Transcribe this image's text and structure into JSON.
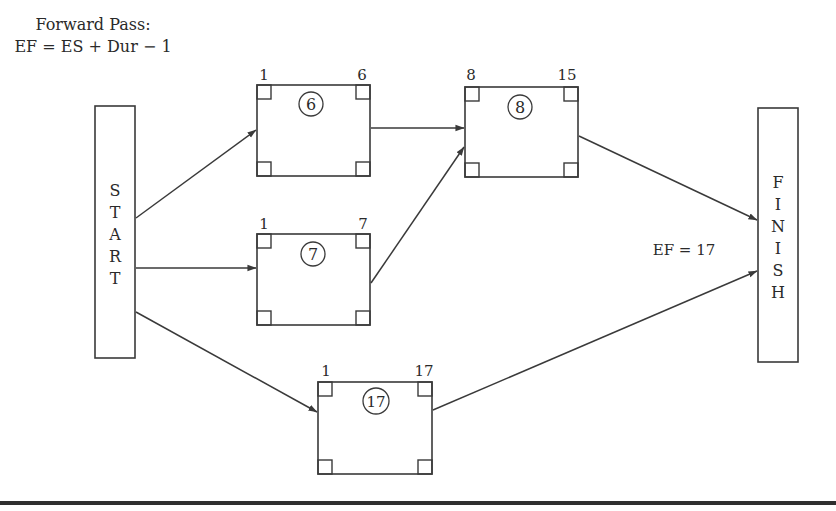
{
  "header": {
    "line1": "Forward Pass:",
    "line2": "EF = ES + Dur − 1"
  },
  "start": {
    "letters": [
      "S",
      "T",
      "A",
      "R",
      "T"
    ]
  },
  "finish": {
    "letters": [
      "F",
      "I",
      "N",
      "I",
      "S",
      "H"
    ]
  },
  "tasks": [
    {
      "id": "task-6",
      "duration": "6",
      "es": "1",
      "ef": "6"
    },
    {
      "id": "task-8",
      "duration": "8",
      "es": "8",
      "ef": "15"
    },
    {
      "id": "task-7",
      "duration": "7",
      "es": "1",
      "ef": "7"
    },
    {
      "id": "task-17",
      "duration": "17",
      "es": "1",
      "ef": "17"
    }
  ],
  "annotation": {
    "project_ef": "EF = 17"
  },
  "edges": [
    {
      "from": "start",
      "to": "task-6"
    },
    {
      "from": "start",
      "to": "task-7"
    },
    {
      "from": "start",
      "to": "task-17"
    },
    {
      "from": "task-6",
      "to": "task-8"
    },
    {
      "from": "task-7",
      "to": "task-8"
    },
    {
      "from": "task-8",
      "to": "finish"
    },
    {
      "from": "task-17",
      "to": "finish"
    }
  ],
  "colors": {
    "stroke": "#3a3a3a",
    "text": "#2a2a2a",
    "background": "#ffffff"
  }
}
